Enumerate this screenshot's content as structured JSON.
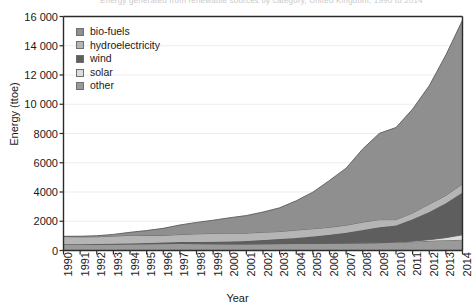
{
  "chart_data": {
    "type": "area",
    "stacked": true,
    "title": "",
    "cut_off_title": "Energy generated from renewable sources by category, United Kingdom, 1990 to 2014",
    "xlabel": "Year",
    "ylabel": "Energy (ttoe)",
    "ylim": [
      0,
      16000
    ],
    "ytick_step": 2000,
    "ytick_labels": [
      "0",
      "2000",
      "4000",
      "6000",
      "8000",
      "10 000",
      "12 000",
      "14 000",
      "16 000"
    ],
    "grid": true,
    "legend_position": "top-left inside plot",
    "categories": [
      "1990",
      "1991",
      "1992",
      "1993",
      "1994",
      "1995",
      "1996",
      "1997",
      "1998",
      "1999",
      "2000",
      "2001",
      "2002",
      "2003",
      "2004",
      "2005",
      "2006",
      "2007",
      "2008",
      "2009",
      "2010",
      "2011",
      "2012",
      "2013",
      "2014"
    ],
    "series": [
      {
        "name": "other",
        "color": "#9a9a9a",
        "values": [
          430,
          430,
          430,
          440,
          450,
          460,
          470,
          480,
          470,
          460,
          450,
          450,
          460,
          470,
          480,
          490,
          500,
          510,
          520,
          530,
          560,
          600,
          660,
          700,
          740
        ]
      },
      {
        "name": "solar",
        "color": "#dcdcdc",
        "values": [
          0,
          0,
          0,
          0,
          0,
          0,
          0,
          0,
          0,
          0,
          0,
          0,
          0,
          0,
          0,
          0,
          0,
          0,
          5,
          10,
          20,
          40,
          80,
          180,
          330
        ]
      },
      {
        "name": "wind",
        "color": "#5e5e5e",
        "values": [
          0,
          5,
          10,
          20,
          35,
          55,
          75,
          95,
          110,
          130,
          160,
          200,
          250,
          310,
          380,
          470,
          570,
          700,
          880,
          1050,
          1130,
          1500,
          1900,
          2350,
          2900
        ]
      },
      {
        "name": "hydroelectricity",
        "color": "#b5b5b5",
        "values": [
          520,
          500,
          500,
          520,
          560,
          520,
          490,
          520,
          560,
          580,
          580,
          540,
          540,
          520,
          540,
          530,
          520,
          520,
          540,
          520,
          400,
          430,
          530,
          540,
          580
        ]
      },
      {
        "name": "bio-fuels",
        "color": "#8f8f8f",
        "values": [
          20,
          40,
          70,
          120,
          200,
          330,
          480,
          650,
          780,
          900,
          1050,
          1200,
          1380,
          1620,
          2000,
          2500,
          3200,
          3900,
          5000,
          5900,
          6300,
          7100,
          8100,
          9600,
          11200
        ]
      }
    ],
    "series_order_bottom_to_top": [
      "other",
      "solar",
      "wind",
      "hydroelectricity",
      "bio-fuels"
    ],
    "legend_entries": [
      {
        "label": "bio-fuels",
        "color": "#8f8f8f"
      },
      {
        "label": "hydroelectricity",
        "color": "#b5b5b5"
      },
      {
        "label": "wind",
        "color": "#5e5e5e"
      },
      {
        "label": "solar",
        "color": "#dcdcdc"
      },
      {
        "label": "other",
        "color": "#9a9a9a"
      }
    ],
    "totals": [
      970,
      975,
      1010,
      1100,
      1245,
      1365,
      1515,
      1745,
      1920,
      2070,
      2240,
      2390,
      2630,
      2920,
      3400,
      3990,
      4790,
      5630,
      6945,
      8010,
      8410,
      9670,
      11270,
      13370,
      15750
    ]
  }
}
